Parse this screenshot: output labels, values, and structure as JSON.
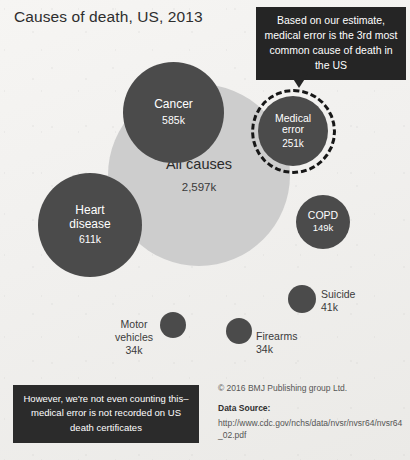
{
  "title": "Causes of death, US, 2013",
  "callout": {
    "text": "Based on our estimate, medical error is the 3rd most common cause of death in the US"
  },
  "bottom_note": {
    "text": "However, we're not even counting this–medical error is not recorded on US death certificates"
  },
  "credits": {
    "copyright": "© 2016 BMJ Publishing group Ltd.",
    "data_source_label": "Data Source:",
    "data_source_url": "http://www.cdc.gov/nchs/data/nvsr/nvsr64/nvsr64_02.pdf"
  },
  "colors": {
    "background": "#f1f0ee",
    "bubble_dark": "#4b4b4b",
    "bubble_light": "#cdcdcd",
    "callout_bg": "#252525",
    "note_bg": "#2b2b2b",
    "highlight_dash": "#171717"
  },
  "chart_data": {
    "type": "bubble",
    "title": "Causes of death, US, 2013",
    "unit": "thousands of deaths (k)",
    "value_units": "k",
    "highlight": "Medical error",
    "legend": "none",
    "grid": false,
    "bubbles": [
      {
        "label": "All causes",
        "value": 2597,
        "value_text": "2,597k",
        "style": "light",
        "label_position": "inside"
      },
      {
        "label": "Heart disease",
        "value": 611,
        "value_text": "611k",
        "style": "dark",
        "label_position": "inside"
      },
      {
        "label": "Cancer",
        "value": 585,
        "value_text": "585k",
        "style": "dark",
        "label_position": "inside"
      },
      {
        "label": "Medical error",
        "value": 251,
        "value_text": "251k",
        "style": "dark",
        "label_position": "inside",
        "highlighted": true
      },
      {
        "label": "COPD",
        "value": 149,
        "value_text": "149k",
        "style": "dark",
        "label_position": "inside"
      },
      {
        "label": "Suicide",
        "value": 41,
        "value_text": "41k",
        "style": "dark",
        "label_position": "outside"
      },
      {
        "label": "Motor vehicles",
        "value": 34,
        "value_text": "34k",
        "style": "dark",
        "label_position": "outside"
      },
      {
        "label": "Firearms",
        "value": 34,
        "value_text": "34k",
        "style": "dark",
        "label_position": "outside"
      }
    ]
  },
  "bubbles": {
    "all_causes": {
      "label": "All causes",
      "value": "2,597k"
    },
    "heart": {
      "label_line1": "Heart",
      "label_line2": "disease",
      "value": "611k"
    },
    "cancer": {
      "label": "Cancer",
      "value": "585k"
    },
    "medical": {
      "label_line1": "Medical",
      "label_line2": "error",
      "value": "251k"
    },
    "copd": {
      "label": "COPD",
      "value": "149k"
    },
    "suicide": {
      "label": "Suicide",
      "value": "41k"
    },
    "motor": {
      "label_line1": "Motor",
      "label_line2": "vehicles",
      "value": "34k"
    },
    "firearms": {
      "label": "Firearms",
      "value": "34k"
    }
  }
}
